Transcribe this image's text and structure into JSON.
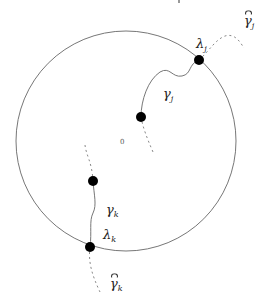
{
  "figure": {
    "circle": {
      "cx": 126,
      "cy": 141,
      "r": 110,
      "stroke": "#777777"
    },
    "origin_label": "0",
    "nodes": [
      {
        "id": "lambda_j",
        "x": 199,
        "y": 60
      },
      {
        "id": "gamma_j_end",
        "x": 141,
        "y": 117
      },
      {
        "id": "gamma_k_end",
        "x": 93,
        "y": 181
      },
      {
        "id": "lambda_k",
        "x": 90,
        "y": 247
      }
    ],
    "labels": {
      "lambda_j": {
        "base": "λ",
        "sub": "j"
      },
      "gamma_j": {
        "base": "γ",
        "sub": "j"
      },
      "gamma_hat_j": {
        "base": "γ",
        "sub": "j",
        "hat": true
      },
      "gamma_k": {
        "base": "γ",
        "sub": "k"
      },
      "lambda_k": {
        "base": "λ",
        "sub": "k"
      },
      "gamma_hat_k": {
        "base": "γ",
        "sub": "k",
        "hat": true
      }
    }
  }
}
